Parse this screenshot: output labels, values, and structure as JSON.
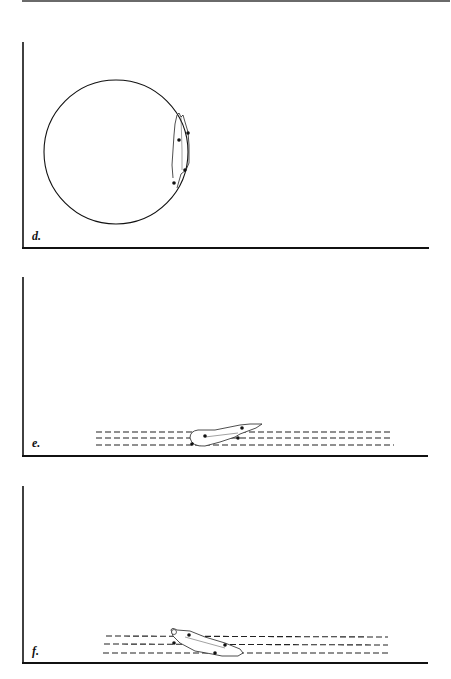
{
  "page": {
    "header_rule": true
  },
  "panels": [
    {
      "label": "d.",
      "description": "Figure with circular path; body figure positioned vertically on the right edge of a circle",
      "element": "circle"
    },
    {
      "label": "e.",
      "description": "Figure lying horizontally over three dashed parallel lines",
      "element": "dashed-lines"
    },
    {
      "label": "f.",
      "description": "Figure lying diagonally over three dashed parallel lines",
      "element": "dashed-lines"
    }
  ],
  "colors": {
    "ink": "#111111",
    "rule": "#6a6a6a",
    "background": "#ffffff"
  }
}
